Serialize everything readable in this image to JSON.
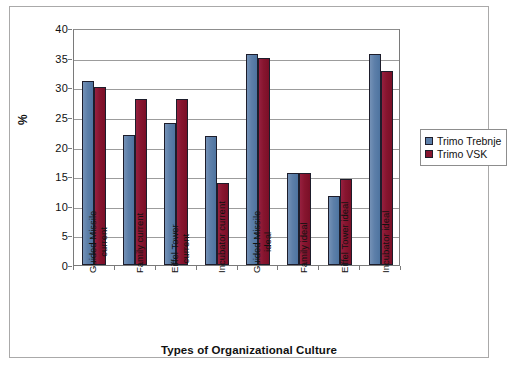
{
  "chart_data": {
    "type": "bar",
    "title": "",
    "xlabel": "Types of Organizational Culture",
    "ylabel": "%",
    "ylim": [
      0,
      40
    ],
    "yticks": [
      0,
      5,
      10,
      15,
      20,
      25,
      30,
      35,
      40
    ],
    "ytick_labels": [
      "0",
      "5",
      "10",
      "15",
      "20",
      "25",
      "30",
      "35",
      "40"
    ],
    "grid": true,
    "legend_position": "right",
    "categories": [
      "Guided Missile current",
      "Family current",
      "Eiffel Tower current",
      "Incubator current",
      "Guided Missile ideal",
      "Family ideal",
      "Eiffel Tower ideal",
      "Incubator ideal"
    ],
    "category_lines": [
      [
        "Guided Missile",
        "current"
      ],
      [
        "Family current"
      ],
      [
        "Eiffel Tower",
        "current"
      ],
      [
        "Incubator current"
      ],
      [
        "Guided Missile",
        "ideal"
      ],
      [
        "Family ideal"
      ],
      [
        "Eiffel Tower ideal"
      ],
      [
        "Incubator ideal"
      ]
    ],
    "series": [
      {
        "name": "Trimo Trebnje",
        "color": "#5d7fa9",
        "values": [
          31.0,
          21.9,
          24.0,
          21.8,
          35.6,
          15.5,
          11.7,
          35.6
        ]
      },
      {
        "name": "Trimo VSK",
        "color": "#87152f",
        "values": [
          30.0,
          28.0,
          28.0,
          13.8,
          34.9,
          15.5,
          14.6,
          32.7
        ]
      }
    ]
  },
  "legend": {
    "items": [
      {
        "label": "Trimo Trebnje",
        "color": "#5d7fa9"
      },
      {
        "label": "Trimo VSK",
        "color": "#87152f"
      }
    ]
  },
  "axes": {
    "y_title": "%",
    "x_title": "Types of Organizational Culture"
  }
}
